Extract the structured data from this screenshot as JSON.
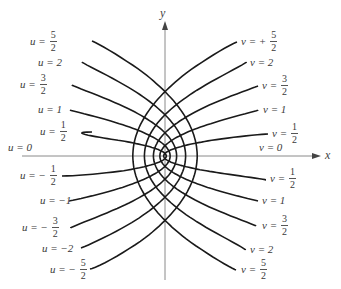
{
  "figure": {
    "type": "parabolic-coordinate-curves",
    "axes": {
      "x_label": "x",
      "y_label": "y"
    },
    "colors": {
      "curve": "#1a1a1a",
      "axis": "#8a8a8a",
      "text": "#3a3a3a"
    },
    "origin_px": [
      165,
      156
    ],
    "scale_px_per_unit": 10.3,
    "u_curves": [
      {
        "value": 0.5,
        "top_label": {
          "text": "u = ",
          "num": "1",
          "den": "2"
        },
        "bottom_label": {
          "text": "u = − ",
          "num": "1",
          "den": "2"
        },
        "top_end_px": [
          92,
          132
        ],
        "bottom_end_px": [
          62,
          176
        ]
      },
      {
        "value": 1,
        "top_label": {
          "text": "u = 1"
        },
        "bottom_label": {
          "text": "u = −1"
        },
        "top_end_px": [
          70,
          110
        ],
        "bottom_end_px": [
          69,
          201
        ]
      },
      {
        "value": 1.5,
        "top_label": {
          "text": "u = ",
          "num": "3",
          "den": "2"
        },
        "bottom_label": {
          "text": "u = − ",
          "num": "3",
          "den": "2"
        },
        "top_end_px": [
          72,
          85
        ],
        "bottom_end_px": [
          71,
          228
        ]
      },
      {
        "value": 2,
        "top_label": {
          "text": "u = 2"
        },
        "bottom_label": {
          "text": "u = −2"
        },
        "top_end_px": [
          82,
          62
        ],
        "bottom_end_px": [
          81,
          248
        ]
      },
      {
        "value": 2.5,
        "top_label": {
          "text": "u = ",
          "num": "5",
          "den": "2"
        },
        "bottom_label": {
          "text": "u = − ",
          "num": "5",
          "den": "2"
        },
        "top_end_px": [
          92,
          41
        ],
        "bottom_end_px": [
          90,
          269
        ]
      }
    ],
    "v_curves": [
      {
        "value": 0.5,
        "top_label": {
          "text": "v = ",
          "num": "1",
          "den": "2"
        },
        "bottom_label": {
          "text": "v = ",
          "num": "1",
          "den": "2"
        },
        "top_end_px": [
          268,
          134
        ],
        "bottom_end_px": [
          265,
          180
        ]
      },
      {
        "value": 1,
        "top_label": {
          "text": "v = 1"
        },
        "bottom_label": {
          "text": "v = 1"
        },
        "top_end_px": [
          258,
          110
        ],
        "bottom_end_px": [
          258,
          201
        ]
      },
      {
        "value": 1.5,
        "top_label": {
          "text": "v = ",
          "num": "3",
          "den": "2"
        },
        "bottom_label": {
          "text": "v = ",
          "num": "3",
          "den": "2"
        },
        "top_end_px": [
          258,
          86
        ],
        "bottom_end_px": [
          256,
          226
        ]
      },
      {
        "value": 2,
        "top_label": {
          "text": "v = 2"
        },
        "bottom_label": {
          "text": "v = 2"
        },
        "top_end_px": [
          246,
          62
        ],
        "bottom_end_px": [
          245,
          250
        ]
      },
      {
        "value": 2.5,
        "top_label": {
          "text": "v = + ",
          "num": "5",
          "den": "2"
        },
        "bottom_label": {
          "text": "v = ",
          "num": "5",
          "den": "2"
        },
        "top_end_px": [
          237,
          42
        ],
        "bottom_end_px": [
          236,
          270
        ]
      }
    ],
    "axis_labels": {
      "u_zero": "u = 0",
      "v_zero": "v = 0"
    },
    "label_positions": {
      "u_top": [
        [
          40,
          126
        ],
        [
          38,
          104
        ],
        [
          20,
          79
        ],
        [
          38,
          57
        ],
        [
          30,
          36
        ]
      ],
      "u_bottom": [
        [
          20,
          170
        ],
        [
          40,
          195
        ],
        [
          22,
          222
        ],
        [
          42,
          243
        ],
        [
          50,
          264
        ]
      ],
      "v_top": [
        [
          272,
          128
        ],
        [
          263,
          104
        ],
        [
          262,
          80
        ],
        [
          250,
          57
        ],
        [
          241,
          36
        ]
      ],
      "v_bottom": [
        [
          270,
          173
        ],
        [
          262,
          195
        ],
        [
          262,
          220
        ],
        [
          250,
          244
        ],
        [
          241,
          264
        ]
      ],
      "u_zero": [
        8,
        142
      ],
      "v_zero": [
        259,
        142
      ],
      "x": [
        325,
        148
      ],
      "y": [
        160,
        6
      ]
    }
  }
}
